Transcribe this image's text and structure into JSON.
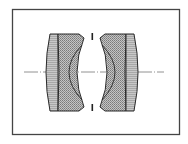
{
  "diagram": {
    "type": "lens-cross-section",
    "colors": {
      "background": "#ffffff",
      "frame": "#444444",
      "outline": "#2a2a2a",
      "glass_light": "#b9b9b9",
      "glass_hatch": "#8c8c8c",
      "axis": "#666666"
    },
    "elements": [
      {
        "id": "left-outer",
        "label": "positive meniscus element",
        "group": "front"
      },
      {
        "id": "left-inner",
        "label": "negative meniscus element (cemented)",
        "group": "front"
      },
      {
        "id": "right-inner",
        "label": "negative meniscus element (cemented)",
        "group": "rear"
      },
      {
        "id": "right-outer",
        "label": "positive element",
        "group": "rear"
      }
    ],
    "stop": {
      "label": "aperture stop"
    },
    "axis": {
      "label": "optical axis"
    }
  }
}
